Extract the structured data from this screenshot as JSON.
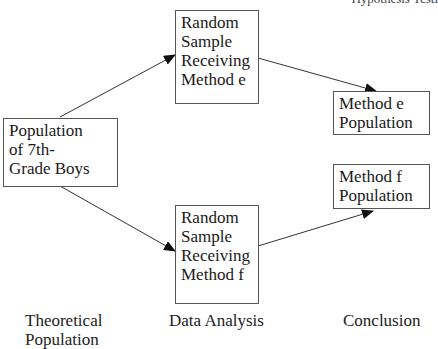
{
  "header": {
    "text": "Hypothesis Testi"
  },
  "nodes": {
    "population": {
      "lines": [
        "Population",
        "of 7th-",
        "Grade Boys"
      ]
    },
    "sample_e": {
      "lines": [
        "Random",
        "Sample",
        "Receiving",
        "Method e"
      ]
    },
    "sample_f": {
      "lines": [
        "Random",
        "Sample",
        "Receiving",
        "Method f"
      ]
    },
    "method_e_population": {
      "lines": [
        "Method e",
        "Population"
      ]
    },
    "method_f_population": {
      "lines": [
        "Method f",
        "Population"
      ]
    }
  },
  "edges": [
    {
      "from": "population",
      "to": "sample_e"
    },
    {
      "from": "population",
      "to": "sample_f"
    },
    {
      "from": "sample_e",
      "to": "method_e_population"
    },
    {
      "from": "sample_f",
      "to": "method_f_population"
    }
  ],
  "stage_labels": {
    "theoretical": {
      "lines": [
        "Theoretical",
        "Population"
      ]
    },
    "data_analysis": {
      "lines": [
        "Data Analysis"
      ]
    },
    "conclusion": {
      "lines": [
        "Conclusion"
      ]
    }
  },
  "colors": {
    "stroke": "#333333",
    "text": "#1a1a1a"
  }
}
